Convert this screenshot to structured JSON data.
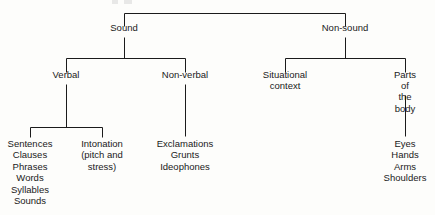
{
  "diagram": {
    "type": "tree",
    "background_color": "#fdfdfb",
    "line_color": "#1b1b1b",
    "text_color": "#1a1a1a",
    "nodes": [
      {
        "id": "sound",
        "label": "Sound",
        "x": 124,
        "y": 28,
        "level": 1
      },
      {
        "id": "nonsound",
        "label": "Non-sound",
        "x": 345,
        "y": 28,
        "level": 1
      },
      {
        "id": "verbal",
        "label": "Verbal",
        "x": 66,
        "y": 75,
        "level": 2
      },
      {
        "id": "nonverbal",
        "label": "Non-verbal",
        "x": 185,
        "y": 75,
        "level": 2
      },
      {
        "id": "situational",
        "label": "Situational\ncontext",
        "x": 285,
        "y": 75,
        "level": 2
      },
      {
        "id": "bodyparts",
        "label": "Parts of\nthe body",
        "x": 405,
        "y": 75,
        "level": 2
      },
      {
        "id": "units",
        "label": "Sentences\nClauses\nPhrases\nWords\nSyllables\nSounds",
        "x": 30,
        "y": 140,
        "level": 3
      },
      {
        "id": "intonation",
        "label": "Intonation\n(pitch and\nstress)",
        "x": 102,
        "y": 140,
        "level": 3
      },
      {
        "id": "vocalnoises",
        "label": "Exclamations\nGrunts\nIdeophones",
        "x": 185,
        "y": 140,
        "level": 3
      },
      {
        "id": "bodylist",
        "label": "Eyes\nHands\nArms\nShoulders",
        "x": 405,
        "y": 140,
        "level": 3
      }
    ],
    "edges": [
      {
        "from": "root",
        "to": "sound"
      },
      {
        "from": "root",
        "to": "nonsound"
      },
      {
        "from": "sound",
        "to": "verbal"
      },
      {
        "from": "sound",
        "to": "nonverbal"
      },
      {
        "from": "nonsound",
        "to": "situational"
      },
      {
        "from": "nonsound",
        "to": "bodyparts"
      },
      {
        "from": "verbal",
        "to": "units"
      },
      {
        "from": "verbal",
        "to": "intonation"
      },
      {
        "from": "nonverbal",
        "to": "vocalnoises"
      },
      {
        "from": "bodyparts",
        "to": "bodylist"
      }
    ]
  }
}
